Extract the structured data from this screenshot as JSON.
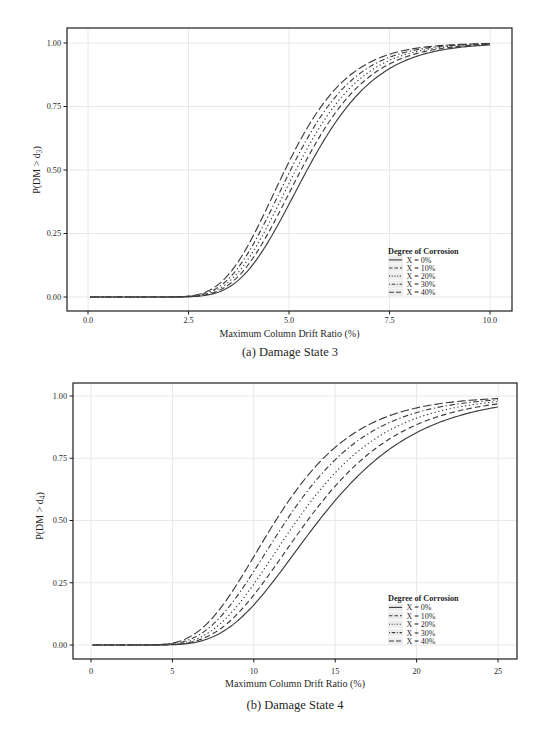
{
  "style": {
    "background": "#ffffff",
    "curve_color": "#3d3d3d",
    "grid_color": "#e8e8e8",
    "axis_color": "#1c1c1c",
    "text_color": "#1f1f1f",
    "legend_key_bg": "#ededed"
  },
  "chart_data": [
    {
      "id": "damage-state-3",
      "type": "line",
      "caption": "(a) Damage State 3",
      "xlabel": "Maximum Column Drift Ratio (%)",
      "ylabel_pre": "P(DM > d",
      "ylabel_sub": "3",
      "ylabel_post": ")",
      "xlim": [
        -0.52,
        10.55
      ],
      "ylim": [
        -0.055,
        1.06
      ],
      "x_ticks": [
        0,
        2.5,
        5,
        7.5,
        10
      ],
      "x_tick_labels": [
        "0.0",
        "2.5",
        "5.0",
        "7.5",
        "10.0"
      ],
      "y_ticks": [
        0,
        0.25,
        0.5,
        0.75,
        1
      ],
      "y_tick_labels": [
        "0.00",
        "0.25",
        "0.50",
        "0.75",
        "1.00"
      ],
      "grid": "major",
      "curve_model": "lognormal_cdf",
      "x_range": [
        0.05,
        10
      ],
      "legend": {
        "title": "Degree of Corrosion",
        "position": "inside-bottom-right"
      },
      "series": [
        {
          "name": "X = 0%",
          "linetype": "solid",
          "median": 5.45,
          "beta": 0.25
        },
        {
          "name": "X = 10%",
          "linetype": "dashed",
          "median": 5.3,
          "beta": 0.25
        },
        {
          "name": "X = 20%",
          "linetype": "dotted",
          "median": 5.17,
          "beta": 0.25
        },
        {
          "name": "X = 30%",
          "linetype": "dotdash",
          "median": 5.04,
          "beta": 0.25
        },
        {
          "name": "X = 40%",
          "linetype": "longdash",
          "median": 4.9,
          "beta": 0.25
        }
      ],
      "sample_x": [
        2.5,
        3,
        4,
        5,
        6,
        7,
        8,
        9,
        10
      ],
      "samples": [
        {
          "name": "X = 0%",
          "y": [
            0.001,
            0.008,
            0.108,
            0.365,
            0.65,
            0.842,
            0.938,
            0.978,
            0.992
          ]
        },
        {
          "name": "X = 10%",
          "y": [
            0.001,
            0.011,
            0.13,
            0.408,
            0.69,
            0.867,
            0.95,
            0.983,
            0.994
          ]
        },
        {
          "name": "X = 20%",
          "y": [
            0.002,
            0.015,
            0.152,
            0.447,
            0.724,
            0.887,
            0.96,
            0.987,
            0.996
          ]
        },
        {
          "name": "X = 30%",
          "y": [
            0.003,
            0.019,
            0.178,
            0.487,
            0.757,
            0.906,
            0.968,
            0.99,
            0.997
          ]
        },
        {
          "name": "X = 40%",
          "y": [
            0.004,
            0.025,
            0.209,
            0.532,
            0.791,
            0.923,
            0.975,
            0.992,
            0.998
          ]
        }
      ]
    },
    {
      "id": "damage-state-4",
      "type": "line",
      "caption": "(b) Damage State 4",
      "xlabel": "Maximum Column Drift Ratio (%)",
      "ylabel_pre": "P(DM > d",
      "ylabel_sub": "4",
      "ylabel_post": ")",
      "xlim": [
        -1.1,
        26.2
      ],
      "ylim": [
        -0.045,
        1.06
      ],
      "x_ticks": [
        0,
        5,
        10,
        15,
        20,
        25
      ],
      "x_tick_labels": [
        "0",
        "5",
        "10",
        "15",
        "20",
        "25"
      ],
      "y_ticks": [
        0,
        0.25,
        0.5,
        0.75,
        1
      ],
      "y_tick_labels": [
        "0.00",
        "0.25",
        "0.50",
        "0.75",
        "1.00"
      ],
      "grid": "major",
      "curve_model": "lognormal_cdf",
      "x_range": [
        0.1,
        25
      ],
      "legend": {
        "title": "Degree of Corrosion",
        "position": "inside-bottom-right"
      },
      "series": [
        {
          "name": "X = 0%",
          "linetype": "solid",
          "median": 14.0,
          "beta": 0.34
        },
        {
          "name": "X = 10%",
          "linetype": "dashed",
          "median": 13.3,
          "beta": 0.34
        },
        {
          "name": "X = 20%",
          "linetype": "dotted",
          "median": 12.65,
          "beta": 0.34
        },
        {
          "name": "X = 30%",
          "linetype": "dotdash",
          "median": 12.0,
          "beta": 0.34
        },
        {
          "name": "X = 40%",
          "linetype": "longdash",
          "median": 11.35,
          "beta": 0.34
        }
      ],
      "sample_x": [
        5,
        7.5,
        10,
        12.5,
        15,
        17.5,
        20,
        22.5,
        25
      ],
      "samples": [
        {
          "name": "X = 0%",
          "y": [
            0.001,
            0.033,
            0.161,
            0.37,
            0.58,
            0.744,
            0.853,
            0.919,
            0.956
          ]
        },
        {
          "name": "X = 10%",
          "y": [
            0.002,
            0.046,
            0.201,
            0.428,
            0.638,
            0.79,
            0.885,
            0.939,
            0.968
          ]
        },
        {
          "name": "X = 20%",
          "y": [
            0.003,
            0.061,
            0.243,
            0.483,
            0.689,
            0.828,
            0.91,
            0.954,
            0.977
          ]
        },
        {
          "name": "X = 30%",
          "y": [
            0.005,
            0.081,
            0.292,
            0.543,
            0.74,
            0.864,
            0.932,
            0.967,
            0.984
          ]
        },
        {
          "name": "X = 40%",
          "y": [
            0.008,
            0.111,
            0.355,
            0.612,
            0.794,
            0.899,
            0.952,
            0.978,
            0.99
          ]
        }
      ]
    }
  ]
}
